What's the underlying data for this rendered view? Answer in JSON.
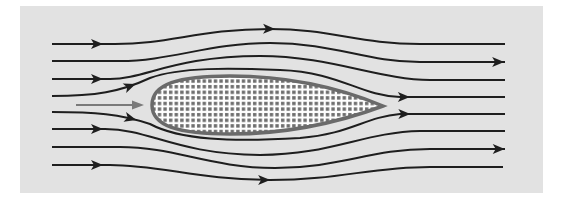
{
  "diagram": {
    "type": "flow-streamlines",
    "colors": {
      "page_background": "#ffffff",
      "panel_background": "#e2e2e2",
      "streamline": "#1e1e1e",
      "airfoil_outline": "#6a6a6a",
      "airfoil_fill": "#ffffff",
      "airfoil_dots": "#6e6e6e",
      "incoming_arrow": "#7a7a7a"
    },
    "panel": {
      "x": 20,
      "y": 6,
      "width": 523,
      "height": 187
    },
    "airfoil": {
      "leading_edge": [
        152,
        105
      ],
      "trailing_edge": [
        383,
        106
      ],
      "top_y": 76,
      "bottom_y": 134,
      "pattern": "dot-grid"
    },
    "incoming_flow_arrow": {
      "x1": 76,
      "y1": 105,
      "x2": 142,
      "y2": 105
    },
    "streamlines": [
      {
        "id": 1,
        "path": "M52,44 L115,44 C170,44 200,29 270,29 C330,29 360,44 420,44 L505,44",
        "arrows": [
          [
            103,
            44
          ],
          [
            275,
            29
          ]
        ]
      },
      {
        "id": 2,
        "path": "M52,61 L120,61 C170,61 210,43 270,43 C335,43 365,62 420,62 L505,62",
        "arrows": [
          [
            505,
            62
          ]
        ]
      },
      {
        "id": 3,
        "path": "M52,79 L110,79 C145,79 175,56 260,56 C330,56 380,80 430,80 L505,80",
        "arrows": [
          [
            103,
            79
          ]
        ]
      },
      {
        "id": 4,
        "path": "M52,96 C95,96 120,92 150,78 C180,67 230,68 280,70 C340,72 360,96 400,97 L505,97",
        "arrows": [
          [
            137,
            88
          ],
          [
            410,
            97
          ]
        ]
      },
      {
        "id": 5,
        "path": "M52,112 C95,112 120,114 150,124 C180,140 230,142 300,138 C350,134 365,117 400,114 L505,114",
        "arrows": [
          [
            137,
            117
          ],
          [
            410,
            115
          ]
        ]
      },
      {
        "id": 6,
        "path": "M52,129 L105,129 C150,129 175,154 260,155 C330,155 365,132 420,131 L505,131",
        "arrows": [
          [
            103,
            129
          ]
        ]
      },
      {
        "id": 7,
        "path": "M52,147 L120,147 C175,147 210,168 275,168 C340,168 370,149 430,149 L505,149",
        "arrows": [
          [
            505,
            149
          ]
        ]
      },
      {
        "id": 8,
        "path": "M52,165 L110,165 C160,165 200,180 270,180 C340,180 370,167 430,167 L503,167",
        "arrows": [
          [
            103,
            165
          ],
          [
            270,
            180
          ]
        ]
      }
    ]
  }
}
